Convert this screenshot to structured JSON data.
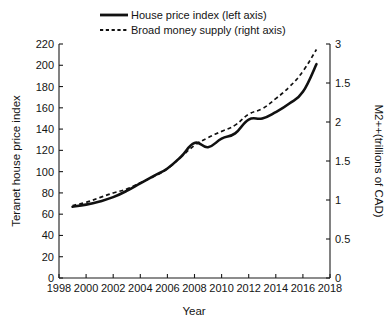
{
  "chart_data": {
    "type": "line",
    "title": "",
    "xlabel": "Year",
    "ylabel": "Teranet house price index",
    "y2label": "M2++(trillions of CAD)",
    "grid": false,
    "legend_position": "top-center",
    "xlim": [
      1998,
      2018
    ],
    "ylim": [
      0,
      220
    ],
    "y2lim": [
      0,
      3
    ],
    "xticks": [
      1998,
      2000,
      2002,
      2004,
      2006,
      2008,
      2010,
      2012,
      2014,
      2016,
      2018
    ],
    "xtick_labels": [
      "1998",
      "2000",
      "2002",
      "2004",
      "2006",
      "2008",
      "2010",
      "2012",
      "2014",
      "2016",
      "2018"
    ],
    "yticks": [
      0,
      20,
      40,
      60,
      80,
      100,
      120,
      140,
      160,
      180,
      200,
      220
    ],
    "ytick_labels": [
      "0",
      "20",
      "40",
      "60",
      "80",
      "100",
      "120",
      "140",
      "160",
      "180",
      "200",
      "220"
    ],
    "y2ticks": [
      0,
      0.5,
      1,
      1.5,
      2,
      2.5,
      3
    ],
    "y2tick_labels": [
      "0",
      "0.5",
      "1",
      "1.5",
      "2",
      "1.5",
      "3"
    ],
    "x": [
      1999,
      2000,
      2001,
      2002,
      2003,
      2004,
      2005,
      2006,
      2007,
      2008,
      2009,
      2010,
      2011,
      2012,
      2013,
      2014,
      2015,
      2016,
      2017
    ],
    "series": [
      {
        "name": "House price index (left axis)",
        "axis": "left",
        "style": "solid",
        "values": [
          67,
          69,
          72,
          76,
          82,
          89,
          96,
          103,
          114,
          127,
          123,
          131,
          136,
          149,
          150,
          156,
          164,
          175,
          201
        ]
      },
      {
        "name": "Broad money supply (right axis)",
        "axis": "right",
        "style": "dashed",
        "values": [
          0.93,
          0.97,
          1.03,
          1.09,
          1.14,
          1.22,
          1.3,
          1.4,
          1.55,
          1.7,
          1.8,
          1.88,
          1.96,
          2.1,
          2.17,
          2.3,
          2.45,
          2.65,
          2.93
        ]
      }
    ]
  },
  "legend": {
    "items": [
      {
        "label": "House price index (left axis)",
        "style": "solid"
      },
      {
        "label": "Broad money supply (right axis)",
        "style": "dashed"
      }
    ]
  },
  "axes": {
    "x_title": "Year",
    "y_left_title": "Teranet house price index",
    "y_right_title": "M2++(trillions of CAD)"
  },
  "colors": {
    "line": "#111111",
    "axis": "#1a1a1a",
    "background": "#ffffff",
    "text": "#141414"
  }
}
